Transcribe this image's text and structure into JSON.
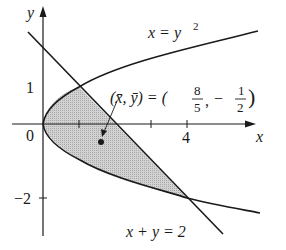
{
  "diagram": {
    "type": "region-between-curves",
    "axes": {
      "x_label": "x",
      "y_label": "y",
      "x_ticks": [
        {
          "value": 2,
          "label": ""
        },
        {
          "value": 4,
          "label": "4"
        }
      ],
      "y_ticks": [
        {
          "value": 1,
          "label": "1"
        },
        {
          "value": -2,
          "label": "−2"
        }
      ],
      "origin_label": "0"
    },
    "curves": [
      {
        "name": "parabola",
        "equation_lhs": "x = y",
        "exponent": "2"
      },
      {
        "name": "line",
        "equation": "x + y = 2"
      }
    ],
    "intersections": [
      [
        1,
        1
      ],
      [
        4,
        -2
      ]
    ],
    "centroid": {
      "label_prefix": "(x̄, ȳ) = (",
      "x_num": "8",
      "x_den": "5",
      "sep": ",",
      "y_sign": "−",
      "y_num": "1",
      "y_den": "2",
      "label_suffix": ")",
      "x": 1.6,
      "y": -0.5
    },
    "colors": {
      "region_fill": "#c8c8c8",
      "stroke": "#1a1a1a"
    }
  }
}
